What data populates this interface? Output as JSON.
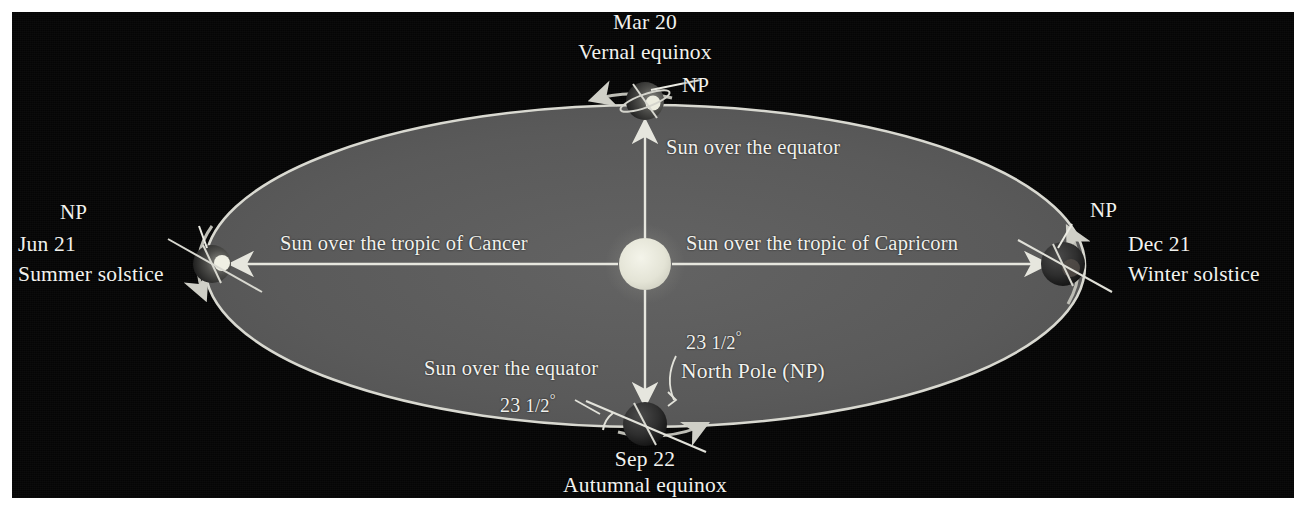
{
  "figure": {
    "title_visible": false,
    "background_color": "#050505",
    "orbit_fill": "#5a5a5a",
    "orbit_stroke": "#d8d8d0",
    "sun_color": "#e8e8dc",
    "text_color": "#f2f2ee",
    "arrow_color": "#e6e6de"
  },
  "sun": {
    "name": "Sun",
    "cx": 645,
    "cy": 264,
    "r": 26
  },
  "orbit": {
    "cx": 645,
    "cy": 266,
    "rx": 440,
    "ry": 161
  },
  "positions": [
    {
      "id": "vernal-equinox",
      "date": "Mar 20",
      "event": "Vernal equinox",
      "pole_label": "NP",
      "x": 645,
      "y": 102
    },
    {
      "id": "summer-solstice",
      "date": "Jun 21",
      "event": "Summer solstice",
      "pole_label": "NP",
      "x": 211,
      "y": 264
    },
    {
      "id": "autumnal-equinox",
      "date": "Sep 22",
      "event": "Autumnal equinox",
      "pole_label": "North Pole (NP)",
      "x": 645,
      "y": 424
    },
    {
      "id": "winter-solstice",
      "date": "Dec 21",
      "event": "Winter solstice",
      "pole_label": "NP",
      "x": 1063,
      "y": 264
    }
  ],
  "sun_rays": [
    {
      "id": "ray-to-cancer",
      "label": "Sun over the tropic of Cancer",
      "direction": "left"
    },
    {
      "id": "ray-to-capricorn",
      "label": "Sun over the tropic of Capricorn",
      "direction": "right"
    },
    {
      "id": "ray-to-equator-north",
      "label": "Sun over the equator",
      "direction": "up"
    },
    {
      "id": "ray-to-equator-south",
      "label": "Sun over the equator",
      "direction": "down"
    }
  ],
  "angles": [
    {
      "id": "tilt-left",
      "value": "23",
      "fraction": "1/2",
      "unit": "°",
      "text": "23 1/2°"
    },
    {
      "id": "tilt-right",
      "value": "23",
      "fraction": "1/2",
      "unit": "°",
      "text": "23 1/2°"
    }
  ],
  "labels": {
    "np": "NP",
    "north_pole_full": "North Pole (NP)",
    "equator_top": "Sun over the equator",
    "equator_bottom": "Sun over the equator",
    "cancer": "Sun over the tropic of Cancer",
    "capricorn": "Sun over the tropic of Capricorn",
    "mar20": "Mar 20",
    "vernal": "Vernal equinox",
    "jun21": "Jun 21",
    "summer": "Summer solstice",
    "sep22": "Sep 22",
    "autumnal": "Autumnal equinox",
    "dec21": "Dec 21",
    "winter": "Winter solstice",
    "angle_num": "23",
    "angle_frac": "1/2",
    "angle_deg": "°"
  }
}
